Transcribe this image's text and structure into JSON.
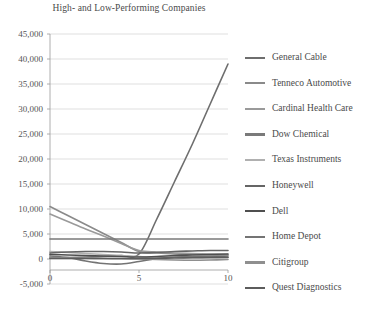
{
  "chart_data": {
    "type": "line",
    "title": "High- and Low-Performing Companies",
    "xlabel": "",
    "ylabel": "",
    "xlim": [
      0,
      10
    ],
    "ylim": [
      -5000,
      45000
    ],
    "x": [
      0,
      1,
      2,
      3,
      4,
      5,
      6,
      7,
      8,
      9,
      10
    ],
    "xticks": [
      "0",
      "5",
      "10"
    ],
    "xtick_values": [
      0,
      5,
      10
    ],
    "yticks": [
      "-5,000",
      "0",
      "5,000",
      "10,000",
      "15,000",
      "20,000",
      "25,000",
      "30,000",
      "35,000",
      "40,000",
      "45,000"
    ],
    "ytick_values": [
      -5000,
      0,
      5000,
      10000,
      15000,
      20000,
      25000,
      30000,
      35000,
      40000,
      45000
    ],
    "grid": true,
    "legend_position": "right",
    "series": [
      {
        "name": "General Cable",
        "color": "#6e6e6e",
        "values": [
          200,
          300,
          400,
          500,
          700,
          1000,
          8000,
          15500,
          23000,
          31000,
          39000
        ]
      },
      {
        "name": "Tenneco Automotive",
        "color": "#8a8a8a",
        "values": [
          10500,
          8700,
          6900,
          5100,
          3300,
          1500,
          1200,
          1000,
          900,
          800,
          700
        ]
      },
      {
        "name": "Cardinal Health Care",
        "color": "#9a9a9a",
        "values": [
          9000,
          7500,
          6000,
          4600,
          3100,
          1700,
          1400,
          1200,
          1100,
          1000,
          900
        ]
      },
      {
        "name": "Dow Chemical",
        "color": "#7a7a7a",
        "values": [
          4000,
          4000,
          4000,
          4000,
          4000,
          4000,
          4000,
          4000,
          4000,
          4000,
          4000
        ]
      },
      {
        "name": "Texas Instruments",
        "color": "#b0b0b0",
        "values": [
          1500,
          1300,
          1100,
          900,
          700,
          500,
          400,
          350,
          300,
          280,
          250
        ]
      },
      {
        "name": "Honeywell",
        "color": "#656565",
        "values": [
          1200,
          1400,
          1500,
          1500,
          1400,
          1200,
          1300,
          1500,
          1600,
          1700,
          1700
        ]
      },
      {
        "name": "Dell",
        "color": "#4f4f4f",
        "values": [
          900,
          800,
          700,
          600,
          500,
          400,
          500,
          700,
          800,
          900,
          1000
        ]
      },
      {
        "name": "Home Depot",
        "color": "#747474",
        "values": [
          600,
          300,
          -400,
          -900,
          -1000,
          -500,
          100,
          400,
          500,
          500,
          400
        ]
      },
      {
        "name": "Citigroup",
        "color": "#8f8f8f",
        "values": [
          300,
          200,
          150,
          100,
          50,
          0,
          -100,
          -200,
          -250,
          -200,
          -100
        ]
      },
      {
        "name": "Quest Diagnostics",
        "color": "#5c5c5c",
        "values": [
          100,
          100,
          100,
          100,
          100,
          100,
          150,
          200,
          250,
          300,
          350
        ]
      }
    ]
  },
  "legend": {
    "items": [
      {
        "label": "General Cable"
      },
      {
        "label": "Tenneco Automotive"
      },
      {
        "label": "Cardinal Health Care"
      },
      {
        "label": "Dow Chemical"
      },
      {
        "label": "Texas Instruments"
      },
      {
        "label": "Honeywell"
      },
      {
        "label": "Dell"
      },
      {
        "label": "Home Depot"
      },
      {
        "label": "Citigroup"
      },
      {
        "label": "Quest Diagnostics"
      }
    ]
  }
}
